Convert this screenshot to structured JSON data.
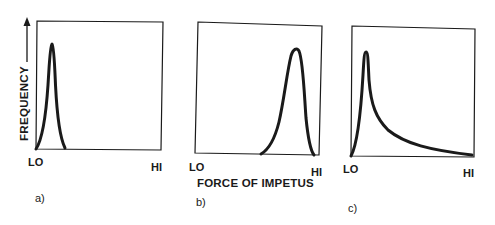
{
  "figure": {
    "y_axis_label": "FREQUENCY",
    "x_axis_label": "FORCE OF IMPETUS",
    "ink_color": "#1a1a1a",
    "panels": [
      {
        "id": "a",
        "label": "a)",
        "x_lo": "LO",
        "x_hi": "HI",
        "shape": "narrow symmetric peak near LO"
      },
      {
        "id": "b",
        "label": "b)",
        "x_lo": "LO",
        "x_hi": "HI",
        "shape": "left-skewed peak near HI"
      },
      {
        "id": "c",
        "label": "c)",
        "x_lo": "LO",
        "x_hi": "HI",
        "shape": "sharp peak near LO with long right tail"
      }
    ]
  }
}
